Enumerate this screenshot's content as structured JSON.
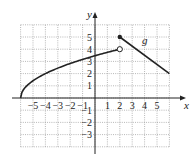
{
  "chart_data": {
    "type": "line",
    "title": "",
    "xlabel": "x",
    "ylabel": "y",
    "xlim": [
      -6,
      6
    ],
    "ylim": [
      -4,
      6
    ],
    "grid": true,
    "x_ticks": [
      "-5",
      "-4",
      "-3",
      "-2",
      "-1",
      "1",
      "2",
      "3",
      "4",
      "5"
    ],
    "y_ticks": [
      "5",
      "4",
      "3",
      "2",
      "1",
      "-1",
      "-2",
      "-3"
    ],
    "series": [
      {
        "name": "g (left piece)",
        "kind": "curve",
        "points": [
          [
            -6,
            0
          ],
          [
            -5,
            1.41
          ],
          [
            -4,
            2
          ],
          [
            -3,
            2.45
          ],
          [
            -2,
            2.83
          ],
          [
            -1,
            3.16
          ],
          [
            0,
            3.46
          ],
          [
            1,
            3.74
          ],
          [
            2,
            4
          ]
        ],
        "start": {
          "x": -6,
          "y": 0,
          "marker": "none"
        },
        "end": {
          "x": 2,
          "y": 4,
          "marker": "open"
        }
      },
      {
        "name": "g (right piece)",
        "kind": "line",
        "points": [
          [
            2,
            5
          ],
          [
            6,
            2
          ]
        ],
        "start": {
          "x": 2,
          "y": 5,
          "marker": "closed"
        },
        "end": {
          "x": 6,
          "y": 2,
          "marker": "none"
        }
      }
    ],
    "annotations": [
      {
        "text": "g",
        "x": 3.8,
        "y": 4.4
      }
    ]
  },
  "labels": {
    "x_axis": "x",
    "y_axis": "y",
    "function": "g"
  }
}
